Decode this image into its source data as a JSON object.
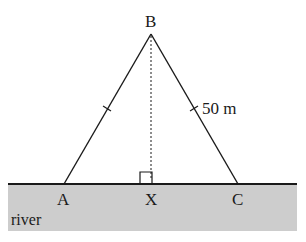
{
  "diagram": {
    "type": "geometry",
    "points": {
      "A": {
        "label": "A",
        "x": 64,
        "y": 184
      },
      "B": {
        "label": "B",
        "x": 151,
        "y": 34
      },
      "C": {
        "label": "C",
        "x": 238,
        "y": 184
      },
      "X": {
        "label": "X",
        "x": 151,
        "y": 184
      }
    },
    "segments": [
      {
        "from": "A",
        "to": "B",
        "style": "solid",
        "tick_marks": 1
      },
      {
        "from": "B",
        "to": "C",
        "style": "solid",
        "tick_marks": 1,
        "length_label": "50 m"
      },
      {
        "from": "B",
        "to": "X",
        "style": "dotted"
      }
    ],
    "right_angle_marker": {
      "at": "X"
    },
    "region": {
      "label": "river",
      "color": "#cfcfcf"
    },
    "labels": {
      "A": "A",
      "B": "B",
      "C": "C",
      "X": "X",
      "bc_length": "50 m",
      "river": "river"
    },
    "colors": {
      "line": "#1a1a1a",
      "river_fill": "#cdcdcd",
      "background": "#ffffff"
    }
  }
}
